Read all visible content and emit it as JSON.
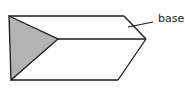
{
  "diagram": {
    "type": "triangular-prism",
    "labels": {
      "base": "base"
    },
    "colors": {
      "stroke": "#1a1a1a",
      "shaded_face": "#b3b3b3",
      "background": "#ffffff"
    }
  }
}
